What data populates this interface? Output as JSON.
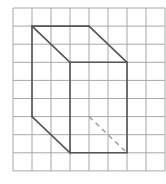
{
  "diagram": {
    "type": "grid-prism-drawing",
    "grid": {
      "columns": 8,
      "rows": 9,
      "origin_px": [
        13,
        8
      ],
      "cell_w": 19,
      "cell_h": 18.1,
      "line_color": "#a8a8a8"
    },
    "solid_edges": [
      {
        "from": [
          1,
          1
        ],
        "to": [
          4,
          1
        ]
      },
      {
        "from": [
          1,
          1
        ],
        "to": [
          1,
          6
        ]
      },
      {
        "from": [
          1,
          1
        ],
        "to": [
          3,
          3
        ]
      },
      {
        "from": [
          4,
          1
        ],
        "to": [
          6,
          3
        ]
      },
      {
        "from": [
          1,
          6
        ],
        "to": [
          3,
          8
        ]
      },
      {
        "from": [
          3,
          3
        ],
        "to": [
          6,
          3
        ]
      },
      {
        "from": [
          3,
          3
        ],
        "to": [
          3,
          8
        ]
      },
      {
        "from": [
          6,
          3
        ],
        "to": [
          6,
          8
        ]
      },
      {
        "from": [
          3,
          8
        ],
        "to": [
          6,
          8
        ]
      }
    ],
    "hidden_edges": [
      {
        "from": [
          4,
          6
        ],
        "to": [
          6,
          8
        ]
      }
    ],
    "colors": {
      "edge": "#555555",
      "hidden_edge": "#9a9a9a"
    }
  }
}
